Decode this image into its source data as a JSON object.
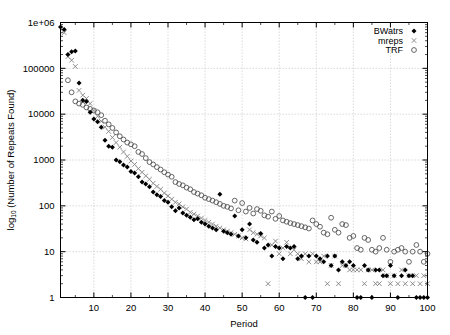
{
  "chart_data": {
    "type": "scatter",
    "title": "",
    "xlabel": "Period",
    "ylabel": "log10 (Number of Repeats Found)",
    "ylabel_base": "log",
    "ylabel_sub": "10",
    "ylabel_rest": " (Number of Repeats Found)",
    "yscale": "log",
    "xscale": "linear",
    "xlim": [
      1,
      100
    ],
    "ylim": [
      1,
      1000000
    ],
    "grid": true,
    "legend_position": "top-right",
    "xticks": [
      10,
      20,
      30,
      40,
      50,
      60,
      70,
      80,
      90,
      100
    ],
    "xtick_labels": [
      "10",
      "20",
      "30",
      "40",
      "50",
      "60",
      "70",
      "80",
      "90",
      "100"
    ],
    "yticks": [
      1,
      10,
      100,
      1000,
      10000,
      100000,
      1000000
    ],
    "ytick_labels": [
      "1",
      "10",
      "100",
      "1000",
      "10000",
      "100000",
      "1e+06"
    ],
    "series": [
      {
        "name": "BWatrs",
        "marker": "filled-diamond",
        "color": "#000000",
        "points": [
          [
            1,
            800000
          ],
          [
            2,
            700000
          ],
          [
            3,
            200000
          ],
          [
            4,
            230000
          ],
          [
            5,
            240000
          ],
          [
            6,
            48000
          ],
          [
            7,
            20000
          ],
          [
            8,
            19000
          ],
          [
            9,
            11000
          ],
          [
            10,
            7800
          ],
          [
            11,
            6800
          ],
          [
            12,
            5200
          ],
          [
            13,
            2700
          ],
          [
            14,
            2000
          ],
          [
            15,
            1900
          ],
          [
            16,
            1000
          ],
          [
            17,
            920
          ],
          [
            18,
            780
          ],
          [
            19,
            700
          ],
          [
            20,
            560
          ],
          [
            21,
            520
          ],
          [
            22,
            430
          ],
          [
            23,
            330
          ],
          [
            24,
            300
          ],
          [
            25,
            260
          ],
          [
            26,
            200
          ],
          [
            27,
            175
          ],
          [
            28,
            160
          ],
          [
            29,
            130
          ],
          [
            30,
            120
          ],
          [
            31,
            95
          ],
          [
            32,
            78
          ],
          [
            33,
            90
          ],
          [
            34,
            70
          ],
          [
            35,
            62
          ],
          [
            36,
            56
          ],
          [
            37,
            50
          ],
          [
            38,
            52
          ],
          [
            39,
            44
          ],
          [
            40,
            40
          ],
          [
            41,
            36
          ],
          [
            42,
            33
          ],
          [
            43,
            30
          ],
          [
            44,
            180
          ],
          [
            45,
            28
          ],
          [
            46,
            26
          ],
          [
            47,
            24
          ],
          [
            48,
            60
          ],
          [
            49,
            22
          ],
          [
            50,
            30
          ],
          [
            51,
            20
          ],
          [
            52,
            40
          ],
          [
            53,
            18
          ],
          [
            54,
            16
          ],
          [
            55,
            25
          ],
          [
            56,
            12
          ],
          [
            57,
            14
          ],
          [
            58,
            8
          ],
          [
            59,
            13
          ],
          [
            60,
            12
          ],
          [
            61,
            7
          ],
          [
            62,
            13
          ],
          [
            63,
            12
          ],
          [
            64,
            13
          ],
          [
            65,
            7
          ],
          [
            66,
            8
          ],
          [
            67,
            1
          ],
          [
            68,
            8
          ],
          [
            69,
            1
          ],
          [
            70,
            8
          ],
          [
            71,
            7
          ],
          [
            72,
            6
          ],
          [
            73,
            8
          ],
          [
            74,
            5
          ],
          [
            75,
            8
          ],
          [
            76,
            4
          ],
          [
            77,
            6
          ],
          [
            78,
            5
          ],
          [
            79,
            6
          ],
          [
            80,
            5
          ],
          [
            81,
            1
          ],
          [
            82,
            1
          ],
          [
            83,
            5
          ],
          [
            84,
            4
          ],
          [
            85,
            1
          ],
          [
            86,
            4
          ],
          [
            87,
            4
          ],
          [
            88,
            3
          ],
          [
            89,
            3
          ],
          [
            90,
            5
          ],
          [
            91,
            3
          ],
          [
            92,
            1
          ],
          [
            93,
            3
          ],
          [
            94,
            4
          ],
          [
            95,
            3
          ],
          [
            96,
            3
          ],
          [
            97,
            1
          ],
          [
            98,
            1
          ],
          [
            99,
            1
          ],
          [
            100,
            1
          ]
        ]
      },
      {
        "name": "mreps",
        "marker": "cross",
        "color": "#808080",
        "points": [
          [
            2,
            600000
          ],
          [
            3,
            180000
          ],
          [
            4,
            150000
          ],
          [
            5,
            110000
          ],
          [
            6,
            33000
          ],
          [
            7,
            26000
          ],
          [
            8,
            22000
          ],
          [
            9,
            17000
          ],
          [
            10,
            12000
          ],
          [
            11,
            9000
          ],
          [
            12,
            7000
          ],
          [
            13,
            5200
          ],
          [
            14,
            4200
          ],
          [
            15,
            3100
          ],
          [
            16,
            2400
          ],
          [
            17,
            1900
          ],
          [
            18,
            1500
          ],
          [
            19,
            1200
          ],
          [
            20,
            950
          ],
          [
            21,
            800
          ],
          [
            22,
            650
          ],
          [
            23,
            540
          ],
          [
            24,
            450
          ],
          [
            25,
            380
          ],
          [
            26,
            310
          ],
          [
            27,
            265
          ],
          [
            28,
            230
          ],
          [
            29,
            190
          ],
          [
            30,
            165
          ],
          [
            31,
            140
          ],
          [
            32,
            120
          ],
          [
            33,
            110
          ],
          [
            34,
            95
          ],
          [
            35,
            85
          ],
          [
            36,
            72
          ],
          [
            37,
            66
          ],
          [
            38,
            60
          ],
          [
            39,
            54
          ],
          [
            40,
            48
          ],
          [
            41,
            44
          ],
          [
            42,
            40
          ],
          [
            43,
            36
          ],
          [
            44,
            33
          ],
          [
            45,
            30
          ],
          [
            46,
            28
          ],
          [
            47,
            26
          ],
          [
            48,
            24
          ],
          [
            49,
            22
          ],
          [
            50,
            20
          ],
          [
            51,
            19
          ],
          [
            52,
            30
          ],
          [
            53,
            26
          ],
          [
            54,
            24
          ],
          [
            55,
            22
          ],
          [
            56,
            20
          ],
          [
            57,
            2
          ],
          [
            58,
            14
          ],
          [
            59,
            17
          ],
          [
            60,
            9
          ],
          [
            61,
            12
          ],
          [
            62,
            16
          ],
          [
            63,
            9
          ],
          [
            64,
            11
          ],
          [
            65,
            9
          ],
          [
            66,
            7
          ],
          [
            67,
            9
          ],
          [
            68,
            6
          ],
          [
            69,
            9
          ],
          [
            70,
            6
          ],
          [
            71,
            6
          ],
          [
            72,
            8
          ],
          [
            73,
            2
          ],
          [
            74,
            5
          ],
          [
            75,
            8
          ],
          [
            76,
            2
          ],
          [
            77,
            5
          ],
          [
            78,
            5
          ],
          [
            79,
            4
          ],
          [
            80,
            4
          ],
          [
            81,
            4
          ],
          [
            82,
            4
          ],
          [
            83,
            2
          ],
          [
            84,
            4
          ],
          [
            85,
            4
          ],
          [
            86,
            2
          ],
          [
            87,
            2
          ],
          [
            88,
            4
          ],
          [
            89,
            3
          ],
          [
            90,
            2
          ],
          [
            91,
            3
          ],
          [
            92,
            2
          ],
          [
            93,
            4
          ],
          [
            94,
            2
          ],
          [
            95,
            3
          ],
          [
            96,
            2
          ],
          [
            97,
            3
          ],
          [
            98,
            2
          ],
          [
            99,
            3
          ],
          [
            100,
            2
          ]
        ]
      },
      {
        "name": "TRF",
        "marker": "open-circle",
        "color": "#555555",
        "points": [
          [
            3,
            55000
          ],
          [
            4,
            30000
          ],
          [
            5,
            19000
          ],
          [
            6,
            17000
          ],
          [
            7,
            16000
          ],
          [
            8,
            14000
          ],
          [
            9,
            13000
          ],
          [
            10,
            12000
          ],
          [
            11,
            11000
          ],
          [
            12,
            9500
          ],
          [
            13,
            7200
          ],
          [
            14,
            6000
          ],
          [
            15,
            5000
          ],
          [
            16,
            4000
          ],
          [
            17,
            3300
          ],
          [
            18,
            2800
          ],
          [
            19,
            2400
          ],
          [
            20,
            2200
          ],
          [
            21,
            2000
          ],
          [
            22,
            1500
          ],
          [
            23,
            1350
          ],
          [
            24,
            1100
          ],
          [
            25,
            900
          ],
          [
            26,
            800
          ],
          [
            27,
            700
          ],
          [
            28,
            620
          ],
          [
            29,
            540
          ],
          [
            30,
            480
          ],
          [
            31,
            430
          ],
          [
            32,
            330
          ],
          [
            33,
            300
          ],
          [
            34,
            280
          ],
          [
            35,
            250
          ],
          [
            36,
            230
          ],
          [
            37,
            200
          ],
          [
            38,
            185
          ],
          [
            39,
            170
          ],
          [
            40,
            150
          ],
          [
            41,
            140
          ],
          [
            42,
            130
          ],
          [
            43,
            120
          ],
          [
            44,
            110
          ],
          [
            45,
            100
          ],
          [
            46,
            95
          ],
          [
            47,
            88
          ],
          [
            48,
            130
          ],
          [
            49,
            80
          ],
          [
            50,
            115
          ],
          [
            51,
            75
          ],
          [
            52,
            90
          ],
          [
            53,
            68
          ],
          [
            54,
            85
          ],
          [
            55,
            78
          ],
          [
            56,
            62
          ],
          [
            57,
            58
          ],
          [
            58,
            75
          ],
          [
            59,
            52
          ],
          [
            60,
            60
          ],
          [
            61,
            48
          ],
          [
            62,
            45
          ],
          [
            63,
            42
          ],
          [
            64,
            40
          ],
          [
            65,
            38
          ],
          [
            66,
            36
          ],
          [
            67,
            34
          ],
          [
            68,
            32
          ],
          [
            69,
            48
          ],
          [
            70,
            40
          ],
          [
            71,
            35
          ],
          [
            72,
            26
          ],
          [
            73,
            24
          ],
          [
            74,
            55
          ],
          [
            75,
            30
          ],
          [
            76,
            26
          ],
          [
            77,
            40
          ],
          [
            78,
            38
          ],
          [
            79,
            20
          ],
          [
            80,
            22
          ],
          [
            81,
            12
          ],
          [
            82,
            11
          ],
          [
            83,
            20
          ],
          [
            84,
            18
          ],
          [
            85,
            11
          ],
          [
            86,
            10
          ],
          [
            87,
            12
          ],
          [
            88,
            20
          ],
          [
            89,
            11
          ],
          [
            90,
            6
          ],
          [
            91,
            10
          ],
          [
            92,
            11
          ],
          [
            93,
            12
          ],
          [
            94,
            10
          ],
          [
            95,
            6
          ],
          [
            96,
            10
          ],
          [
            97,
            14
          ],
          [
            98,
            10
          ],
          [
            99,
            6
          ],
          [
            100,
            9
          ]
        ]
      }
    ]
  },
  "legend": {
    "entries": [
      {
        "label": "BWatrs",
        "marker": "filled-diamond"
      },
      {
        "label": "mreps",
        "marker": "cross"
      },
      {
        "label": "TRF",
        "marker": "open-circle"
      }
    ]
  },
  "colors": {
    "axis": "#000000",
    "grid": "#c8c8c8",
    "background": "#ffffff",
    "bwatrs": "#000000",
    "mreps": "#808080",
    "trf": "#555555"
  }
}
